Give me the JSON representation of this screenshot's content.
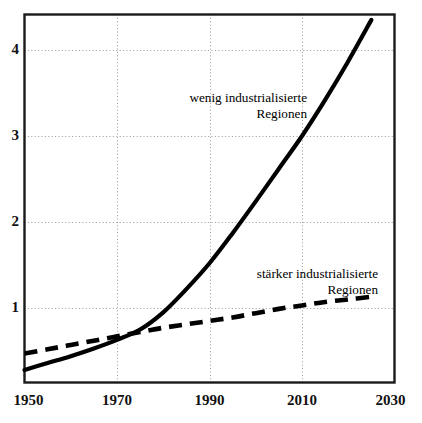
{
  "chart_data": {
    "type": "line",
    "title": "",
    "xlabel": "",
    "ylabel": "",
    "xlim": [
      1950,
      2030
    ],
    "ylim": [
      0,
      4.6
    ],
    "grid": true,
    "legend_position": "inline-annotations",
    "x_ticks": [
      "1950",
      "1970",
      "1990",
      "2010",
      "2030"
    ],
    "x_tick_values": [
      1950,
      1970,
      1990,
      2010,
      2030
    ],
    "y_ticks": [
      "1",
      "2",
      "3",
      "4"
    ],
    "y_tick_values": [
      1,
      2,
      3,
      4
    ],
    "series": [
      {
        "name": "wenig industrialisierte Regionen",
        "style": "solid",
        "color": "#000000",
        "x": [
          1950,
          1955,
          1960,
          1965,
          1970,
          1975,
          1980,
          1985,
          1990,
          1995,
          2000,
          2005,
          2010,
          2015,
          2020,
          2025
        ],
        "values": [
          0.28,
          0.36,
          0.44,
          0.53,
          0.63,
          0.75,
          0.95,
          1.22,
          1.52,
          1.87,
          2.24,
          2.62,
          3.0,
          3.42,
          3.87,
          4.35
        ]
      },
      {
        "name": "stärker industrialisierte Regionen",
        "style": "dashed",
        "color": "#000000",
        "x": [
          1950,
          1955,
          1960,
          1965,
          1970,
          1975,
          1980,
          1985,
          1990,
          1995,
          2000,
          2005,
          2010,
          2015,
          2020,
          2025
        ],
        "values": [
          0.47,
          0.52,
          0.57,
          0.62,
          0.67,
          0.72,
          0.77,
          0.81,
          0.85,
          0.89,
          0.94,
          0.99,
          1.03,
          1.07,
          1.1,
          1.13
        ]
      }
    ],
    "annotations": [
      {
        "name": "wenig-industrialisierte",
        "line1": "wenig industrialisierte",
        "line2": "Regionen"
      },
      {
        "name": "staerker-industrialisierte",
        "line1": "stärker industrialisierte",
        "line2": "Regionen"
      }
    ]
  },
  "colors": {
    "background": "#ffffff",
    "frame": "#1a1a1a",
    "grid": "#9a9a9a",
    "curve": "#000000",
    "text": "#111111"
  }
}
